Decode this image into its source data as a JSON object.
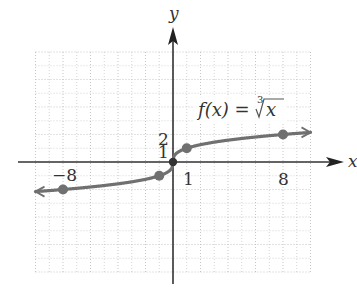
{
  "chart_data": {
    "type": "line",
    "title": "",
    "function_label": "f(x) = ∛x",
    "function_label_parts": {
      "lhs": "f(x) = ",
      "root_index": "3",
      "radicand": "x"
    },
    "xlabel": "x",
    "ylabel": "y",
    "xlim": [
      -10,
      10
    ],
    "ylim": [
      -8,
      8
    ],
    "grid": true,
    "tick_labels": {
      "x": [
        {
          "value": -8,
          "label": "−8"
        },
        {
          "value": 1,
          "label": "1"
        },
        {
          "value": 8,
          "label": "8"
        }
      ],
      "y": [
        {
          "value": 1,
          "label": "1"
        },
        {
          "value": 2,
          "label": "2"
        }
      ]
    },
    "points": [
      {
        "x": -8,
        "y": -2
      },
      {
        "x": -1,
        "y": -1
      },
      {
        "x": 0,
        "y": 0
      },
      {
        "x": 1,
        "y": 1
      },
      {
        "x": 8,
        "y": 2
      }
    ],
    "curve_color": "#707070",
    "axis_color": "#333333",
    "grid_color": "#b8b8b8"
  }
}
